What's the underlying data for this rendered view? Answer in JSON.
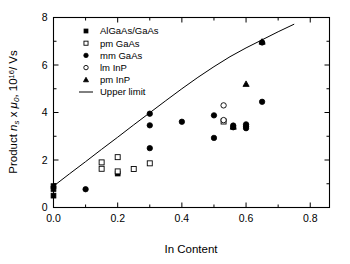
{
  "chart_data": {
    "type": "scatter",
    "title": "",
    "xlabel": "In Content",
    "ylabel_parts": {
      "prefix": "Product ",
      "n": "n",
      "n_sub": "s",
      "times": " x ",
      "mu": "μ",
      "mu_sub": "0",
      "suffix": ", 10",
      "exp": "16",
      "tail": "/ Vs"
    },
    "ylabel": "Product n_s x μ_0, 10^16/ Vs",
    "xlim": [
      0.0,
      0.86
    ],
    "ylim": [
      0.0,
      8.0
    ],
    "xticks": [
      0.0,
      0.2,
      0.4,
      0.6,
      0.8
    ],
    "xtick_labels": [
      "0.0",
      "0.2",
      "0.4",
      "0.6",
      "0.8"
    ],
    "yticks": [
      0,
      2,
      4,
      6,
      8
    ],
    "ytick_labels": [
      "0",
      "2",
      "4",
      "6",
      "8"
    ],
    "x_minor_ticks": [
      0.1,
      0.3,
      0.5,
      0.7
    ],
    "y_minor_ticks": [
      1,
      3,
      5,
      7
    ],
    "grid": false,
    "legend_position": "upper-left-inside",
    "series": [
      {
        "name": "AlGaAs/GaAs",
        "marker": "filled-square",
        "points": [
          {
            "x": 0.0,
            "y": 0.5
          },
          {
            "x": 0.0,
            "y": 0.78
          },
          {
            "x": 0.0,
            "y": 0.9
          },
          {
            "x": 0.2,
            "y": 1.43
          }
        ]
      },
      {
        "name": "pm GaAs",
        "marker": "open-square",
        "points": [
          {
            "x": 0.15,
            "y": 1.9
          },
          {
            "x": 0.15,
            "y": 1.63
          },
          {
            "x": 0.2,
            "y": 2.12
          },
          {
            "x": 0.2,
            "y": 1.52
          },
          {
            "x": 0.25,
            "y": 1.62
          },
          {
            "x": 0.3,
            "y": 1.86
          },
          {
            "x": 0.53,
            "y": 3.62
          }
        ]
      },
      {
        "name": "mm GaAs",
        "marker": "filled-circle",
        "points": [
          {
            "x": 0.1,
            "y": 0.77
          },
          {
            "x": 0.3,
            "y": 3.95
          },
          {
            "x": 0.3,
            "y": 3.46
          },
          {
            "x": 0.3,
            "y": 2.5
          },
          {
            "x": 0.4,
            "y": 3.61
          },
          {
            "x": 0.5,
            "y": 3.88
          },
          {
            "x": 0.5,
            "y": 2.93
          },
          {
            "x": 0.56,
            "y": 3.45
          },
          {
            "x": 0.56,
            "y": 3.38
          },
          {
            "x": 0.6,
            "y": 3.5
          },
          {
            "x": 0.6,
            "y": 3.42
          },
          {
            "x": 0.6,
            "y": 3.34
          },
          {
            "x": 0.65,
            "y": 4.45
          },
          {
            "x": 0.65,
            "y": 6.95
          }
        ]
      },
      {
        "name": "lm InP",
        "marker": "open-circle",
        "points": [
          {
            "x": 0.53,
            "y": 4.3
          },
          {
            "x": 0.53,
            "y": 3.68
          }
        ]
      },
      {
        "name": "pm InP",
        "marker": "filled-triangle",
        "points": [
          {
            "x": 0.56,
            "y": 3.4
          },
          {
            "x": 0.6,
            "y": 5.2
          },
          {
            "x": 0.65,
            "y": 6.98
          }
        ]
      },
      {
        "name": "Upper limit",
        "marker": "line",
        "points": [
          {
            "x": 0.0,
            "y": 0.9
          },
          {
            "x": 0.05,
            "y": 1.42
          },
          {
            "x": 0.1,
            "y": 1.93
          },
          {
            "x": 0.15,
            "y": 2.45
          },
          {
            "x": 0.2,
            "y": 2.96
          },
          {
            "x": 0.25,
            "y": 3.48
          },
          {
            "x": 0.3,
            "y": 3.99
          },
          {
            "x": 0.35,
            "y": 4.5
          },
          {
            "x": 0.4,
            "y": 5.0
          },
          {
            "x": 0.45,
            "y": 5.48
          },
          {
            "x": 0.5,
            "y": 5.93
          },
          {
            "x": 0.55,
            "y": 6.35
          },
          {
            "x": 0.6,
            "y": 6.72
          },
          {
            "x": 0.65,
            "y": 7.06
          },
          {
            "x": 0.7,
            "y": 7.4
          },
          {
            "x": 0.75,
            "y": 7.72
          }
        ]
      }
    ],
    "legend": [
      {
        "label": "AlGaAs/GaAs",
        "marker": "filled-square"
      },
      {
        "label": "pm GaAs",
        "marker": "open-square"
      },
      {
        "label": "mm GaAs",
        "marker": "filled-circle"
      },
      {
        "label": "lm InP",
        "marker": "open-circle"
      },
      {
        "label": "pm InP",
        "marker": "filled-triangle"
      },
      {
        "label": "Upper limit",
        "marker": "line"
      }
    ]
  }
}
